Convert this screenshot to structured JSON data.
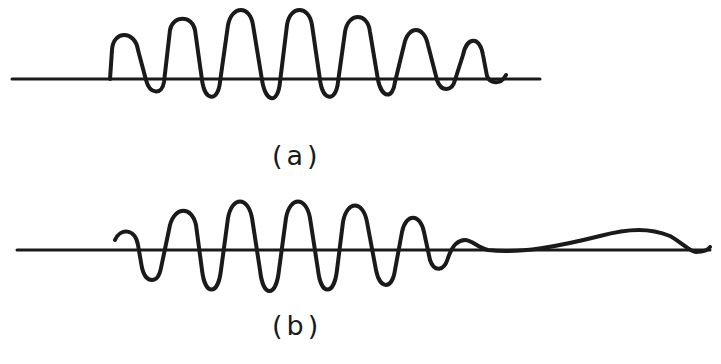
{
  "figure": {
    "stroke_color": "#1a1a1a",
    "background": "#ffffff",
    "panels": [
      {
        "id": "a",
        "label": "(a)",
        "description": "Oscillatory waveform with growing then decaying amplitude, biased above baseline",
        "baseline": {
          "y": 79,
          "x_start": 12,
          "x_end": 540
        },
        "path": "M 110 79 L 112 50 C 113 30, 135 30, 138 50 L 146 80 C 150 95, 162 95, 164 82 L 170 30 C 173 15, 192 15, 195 30 L 202 80 C 205 102, 218 102, 220 82 L 228 25 C 232 5, 250 5, 253 25 L 262 80 C 266 104, 278 104, 280 82 L 287 25 C 290 5, 309 5, 312 25 L 320 80 C 323 102, 336 102, 338 82 L 345 32 C 348 12, 368 12, 370 32 L 378 80 C 382 99, 393 99, 395 82 L 404 45 C 408 25, 424 25, 428 45 L 437 80 C 441 92, 452 92, 455 80 L 463 55 C 467 36, 480 36, 483 55 L 487 76 C 490 84, 500 84, 504 78 L 506 75"
      },
      {
        "id": "b",
        "label": "(b)",
        "description": "Oscillatory waveform with leading hook, symmetric swings, decaying tail followed by a broad low hump",
        "baseline": {
          "y": 250,
          "x_start": 17,
          "x_end": 710
        },
        "path": "M 115 240 C 120 228, 135 228, 138 245 L 142 268 C 146 284, 158 284, 161 268 L 170 225 C 175 206, 192 206, 196 225 L 202 270 C 205 296, 218 296, 221 270 L 228 218 C 232 196, 248 196, 252 218 L 260 270 C 263 298, 276 298, 279 270 L 286 218 C 290 196, 306 196, 310 218 L 318 270 C 321 296, 334 296, 337 270 L 343 222 C 347 200, 363 200, 367 222 L 376 270 C 380 290, 392 290, 395 270 L 402 232 C 406 213, 420 213, 424 232 L 430 260 C 434 272, 444 272, 448 258 C 452 246, 458 240, 465 240 C 472 240, 478 248, 488 250 C 520 254, 560 246, 600 236 C 630 228, 650 228, 670 236 C 684 244, 690 252, 696 252 C 702 252, 708 250, 710 247"
      }
    ]
  }
}
